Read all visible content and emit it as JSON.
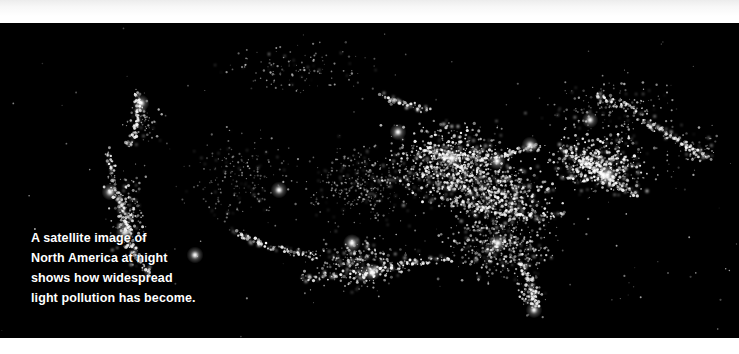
{
  "page": {
    "width": 739,
    "height": 354,
    "background_color": "#ffffff"
  },
  "bands": {
    "top": {
      "color": "#ffffff",
      "height": 23
    },
    "bottom": {
      "color": "#ffffff",
      "height": 16
    }
  },
  "photo": {
    "name": "satellite-night-lights-north-america",
    "background_color": "#000000",
    "light_color": "#ffffff",
    "region": "North America",
    "subject": "Earth at night / city lights / light pollution"
  },
  "caption": {
    "color": "#ffffff",
    "lines": [
      "A satellite image of",
      "North America at night",
      "shows how widespread",
      "light pollution has become."
    ],
    "full_text": "A satellite image of North America at night shows how widespread light pollution has become."
  },
  "chart_data": {
    "type": "scatter",
    "xlabel": "",
    "ylabel": "",
    "background": "#000000",
    "point_color": "#ffffff",
    "clusters": [
      {
        "name": "northeast-corridor",
        "cx": 600,
        "cy": 165,
        "rx": 70,
        "ry": 40,
        "density": 1.0,
        "brightness": 1.0
      },
      {
        "name": "great-lakes-midwest",
        "cx": 450,
        "cy": 165,
        "rx": 85,
        "ry": 55,
        "density": 0.95,
        "brightness": 0.95
      },
      {
        "name": "ohio-valley",
        "cx": 500,
        "cy": 195,
        "rx": 70,
        "ry": 45,
        "density": 0.9,
        "brightness": 0.9
      },
      {
        "name": "southeast",
        "cx": 500,
        "cy": 245,
        "rx": 75,
        "ry": 45,
        "density": 0.75,
        "brightness": 0.8
      },
      {
        "name": "florida-peninsula",
        "cx": 530,
        "cy": 290,
        "rx": 22,
        "ry": 32,
        "density": 0.55,
        "brightness": 0.85
      },
      {
        "name": "gulf-coast-texas",
        "cx": 360,
        "cy": 265,
        "rx": 70,
        "ry": 38,
        "density": 0.6,
        "brightness": 0.85
      },
      {
        "name": "plains",
        "cx": 360,
        "cy": 185,
        "rx": 80,
        "ry": 55,
        "density": 0.45,
        "brightness": 0.6
      },
      {
        "name": "mountain-west",
        "cx": 235,
        "cy": 180,
        "rx": 75,
        "ry": 70,
        "density": 0.22,
        "brightness": 0.55
      },
      {
        "name": "west-coast",
        "cx": 128,
        "cy": 215,
        "rx": 28,
        "ry": 75,
        "density": 0.45,
        "brightness": 0.9
      },
      {
        "name": "pacific-northwest",
        "cx": 140,
        "cy": 120,
        "rx": 30,
        "ry": 35,
        "density": 0.3,
        "brightness": 0.7
      },
      {
        "name": "canada-prairies",
        "cx": 300,
        "cy": 70,
        "rx": 120,
        "ry": 38,
        "density": 0.18,
        "brightness": 0.6
      },
      {
        "name": "eastern-canada",
        "cx": 610,
        "cy": 110,
        "rx": 90,
        "ry": 45,
        "density": 0.3,
        "brightness": 0.7
      },
      {
        "name": "maritimes",
        "cx": 690,
        "cy": 150,
        "rx": 45,
        "ry": 30,
        "density": 0.3,
        "brightness": 0.75
      }
    ],
    "bright_cities": [
      {
        "name": "chicago",
        "x": 452,
        "y": 158,
        "magnitude": 1.0
      },
      {
        "name": "new-york",
        "x": 607,
        "y": 175,
        "magnitude": 1.0
      },
      {
        "name": "los-angeles",
        "x": 125,
        "y": 233,
        "magnitude": 1.0
      },
      {
        "name": "dallas",
        "x": 352,
        "y": 243,
        "magnitude": 0.9
      },
      {
        "name": "houston",
        "x": 372,
        "y": 272,
        "magnitude": 0.9
      },
      {
        "name": "atlanta",
        "x": 498,
        "y": 243,
        "magnitude": 0.85
      },
      {
        "name": "detroit",
        "x": 497,
        "y": 161,
        "magnitude": 0.85
      },
      {
        "name": "denver",
        "x": 279,
        "y": 190,
        "magnitude": 0.8
      },
      {
        "name": "seattle",
        "x": 141,
        "y": 103,
        "magnitude": 0.8
      },
      {
        "name": "phoenix",
        "x": 195,
        "y": 255,
        "magnitude": 0.8
      },
      {
        "name": "minneapolis",
        "x": 398,
        "y": 132,
        "magnitude": 0.8
      },
      {
        "name": "san-francisco",
        "x": 110,
        "y": 192,
        "magnitude": 0.8
      },
      {
        "name": "miami",
        "x": 534,
        "y": 310,
        "magnitude": 0.75
      },
      {
        "name": "toronto",
        "x": 530,
        "y": 145,
        "magnitude": 0.8
      },
      {
        "name": "montreal",
        "x": 590,
        "y": 120,
        "magnitude": 0.75
      }
    ]
  }
}
